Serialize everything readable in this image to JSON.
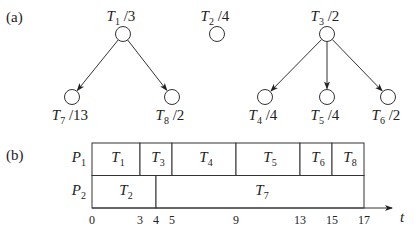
{
  "panel_a": {
    "label": "(a)",
    "nodes": [
      {
        "id": "T1",
        "name": "T",
        "sub": "1",
        "weight": "/3",
        "x": 123,
        "y": 34
      },
      {
        "id": "T2",
        "name": "T",
        "sub": "2",
        "weight": "/4",
        "x": 217,
        "y": 34
      },
      {
        "id": "T3",
        "name": "T",
        "sub": "3",
        "weight": "/2",
        "x": 327,
        "y": 34
      },
      {
        "id": "T7",
        "name": "T",
        "sub": "7",
        "weight": "/13",
        "x": 72,
        "y": 97
      },
      {
        "id": "T8",
        "name": "T",
        "sub": "8",
        "weight": "/2",
        "x": 172,
        "y": 97
      },
      {
        "id": "T4",
        "name": "T",
        "sub": "4",
        "weight": "/4",
        "x": 265,
        "y": 97
      },
      {
        "id": "T5",
        "name": "T",
        "sub": "5",
        "weight": "/4",
        "x": 327,
        "y": 97
      },
      {
        "id": "T6",
        "name": "T",
        "sub": "6",
        "weight": "/2",
        "x": 388,
        "y": 97
      }
    ],
    "edges": [
      {
        "from": "T1",
        "to": "T7"
      },
      {
        "from": "T1",
        "to": "T8"
      },
      {
        "from": "T3",
        "to": "T4"
      },
      {
        "from": "T3",
        "to": "T5"
      },
      {
        "from": "T3",
        "to": "T6"
      }
    ]
  },
  "panel_b": {
    "label": "(b)",
    "axis_label": "t",
    "ticks": [
      "0",
      "3",
      "4",
      "5",
      "9",
      "13",
      "15",
      "17"
    ],
    "processors": [
      {
        "name": "P",
        "sub": "1",
        "tasks": [
          {
            "name": "T",
            "sub": "1",
            "start": 0,
            "end": 3
          },
          {
            "name": "T",
            "sub": "3",
            "start": 3,
            "end": 5
          },
          {
            "name": "T",
            "sub": "4",
            "start": 5,
            "end": 9
          },
          {
            "name": "T",
            "sub": "5",
            "start": 9,
            "end": 13
          },
          {
            "name": "T",
            "sub": "6",
            "start": 13,
            "end": 15
          },
          {
            "name": "T",
            "sub": "8",
            "start": 15,
            "end": 17
          }
        ]
      },
      {
        "name": "P",
        "sub": "2",
        "tasks": [
          {
            "name": "T",
            "sub": "2",
            "start": 0,
            "end": 4
          },
          {
            "name": "T",
            "sub": "7",
            "start": 4,
            "end": 17
          }
        ]
      }
    ]
  }
}
